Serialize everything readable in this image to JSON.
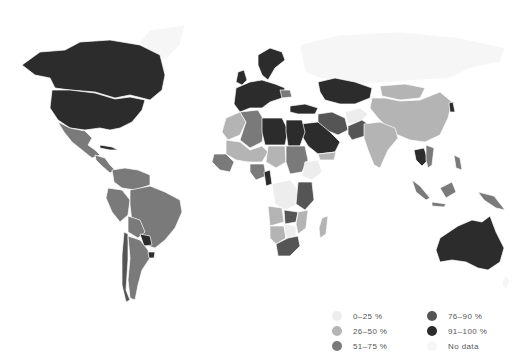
{
  "caption": "· · · · · · · · · · · ·",
  "map": {
    "colors": {
      "c0_25": "#ededed",
      "c26_50": "#b4b4b4",
      "c51_75": "#7a7a7a",
      "c76_90": "#555555",
      "c91_100": "#2c2c2c",
      "no_data": "#f6f6f6"
    },
    "regions": [
      {
        "name": "Canada",
        "category": "91-100%"
      },
      {
        "name": "United States",
        "category": "91-100%"
      },
      {
        "name": "Greenland",
        "category": "No data"
      },
      {
        "name": "Mexico",
        "category": "51-75%"
      },
      {
        "name": "Central America",
        "category": "51-75%"
      },
      {
        "name": "Colombia / Venezuela",
        "category": "51-75%"
      },
      {
        "name": "Brazil",
        "category": "51-75%"
      },
      {
        "name": "Peru",
        "category": "51-75%"
      },
      {
        "name": "Bolivia",
        "category": "51-75%"
      },
      {
        "name": "Paraguay",
        "category": "91-100%"
      },
      {
        "name": "Argentina",
        "category": "51-75%"
      },
      {
        "name": "Chile",
        "category": "76-90%"
      },
      {
        "name": "Uruguay",
        "category": "91-100%"
      },
      {
        "name": "Western Europe",
        "category": "91-100%"
      },
      {
        "name": "Scandinavia",
        "category": "91-100%"
      },
      {
        "name": "Romania",
        "category": "51-75%"
      },
      {
        "name": "Turkey",
        "category": "91-100%"
      },
      {
        "name": "Russia",
        "category": "No data"
      },
      {
        "name": "Kazakhstan",
        "category": "91-100%"
      },
      {
        "name": "China",
        "category": "26-50%"
      },
      {
        "name": "Mongolia",
        "category": "26-50%"
      },
      {
        "name": "India",
        "category": "26-50%"
      },
      {
        "name": "Iran",
        "category": "76-90%"
      },
      {
        "name": "Afghanistan",
        "category": "0-25%"
      },
      {
        "name": "Pakistan",
        "category": "76-90%"
      },
      {
        "name": "Saudi Arabia",
        "category": "91-100%"
      },
      {
        "name": "Algeria",
        "category": "51-75%"
      },
      {
        "name": "Libya",
        "category": "91-100%"
      },
      {
        "name": "Egypt",
        "category": "91-100%"
      },
      {
        "name": "Mali/Niger",
        "category": "26-50%"
      },
      {
        "name": "Sudan",
        "category": "51-75%"
      },
      {
        "name": "Ethiopia",
        "category": "0-25%"
      },
      {
        "name": "Nigeria",
        "category": "51-75%"
      },
      {
        "name": "Cameroon",
        "category": "91-100%"
      },
      {
        "name": "DR Congo",
        "category": "0-25%"
      },
      {
        "name": "Tanzania",
        "category": "76-90%"
      },
      {
        "name": "Angola",
        "category": "26-50%"
      },
      {
        "name": "Zambia",
        "category": "76-90%"
      },
      {
        "name": "Namibia",
        "category": "26-50%"
      },
      {
        "name": "South Africa",
        "category": "76-90%"
      },
      {
        "name": "Madagascar",
        "category": "26-50%"
      },
      {
        "name": "Thailand",
        "category": "91-100%"
      },
      {
        "name": "Indonesia",
        "category": "51-75%"
      },
      {
        "name": "Papua New Guinea",
        "category": "51-75%"
      },
      {
        "name": "Australia",
        "category": "91-100%"
      },
      {
        "name": "Japan/Korea",
        "category": "91-100%"
      }
    ]
  },
  "legend": {
    "items": [
      {
        "label": "0–25 %",
        "color": "#ededed"
      },
      {
        "label": "26–50 %",
        "color": "#b4b4b4"
      },
      {
        "label": "51–75 %",
        "color": "#7a7a7a"
      },
      {
        "label": "76–90 %",
        "color": "#555555"
      },
      {
        "label": "91–100 %",
        "color": "#2c2c2c"
      },
      {
        "label": "No data",
        "color": "#f6f6f6"
      }
    ]
  }
}
